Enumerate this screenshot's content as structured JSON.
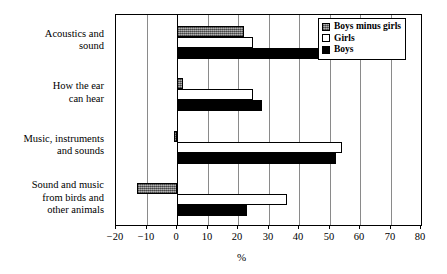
{
  "chart_data": {
    "type": "bar",
    "orientation": "horizontal",
    "title": "",
    "xlabel": "%",
    "ylabel": "",
    "xlim": [
      -20,
      80
    ],
    "xticks": [
      -20,
      -10,
      0,
      10,
      20,
      30,
      40,
      50,
      60,
      70,
      80
    ],
    "xtick_labels": [
      "−20",
      "−10",
      "0",
      "10",
      "20",
      "30",
      "40",
      "50",
      "60",
      "70",
      "80"
    ],
    "grid": true,
    "grid_axis": "x",
    "legend_position": "top-right",
    "categories": [
      "Acoustics and sound",
      "How the ear can hear",
      "Music, instruments and sounds",
      "Sound and music from birds and other animals"
    ],
    "category_label_lines": [
      [
        "Acoustics and",
        "sound"
      ],
      [
        "How the ear",
        "can hear"
      ],
      [
        "Music, instruments",
        "and sounds"
      ],
      [
        "Sound and music",
        "from birds and",
        "other animals"
      ]
    ],
    "series": [
      {
        "name": "Boys minus girls",
        "color": "#808080",
        "fill": "hatched-gray",
        "values": [
          22,
          2,
          -1,
          -13
        ]
      },
      {
        "name": "Girls",
        "color": "#ffffff",
        "fill": "white",
        "values": [
          25,
          25,
          54,
          36
        ]
      },
      {
        "name": "Boys",
        "color": "#000000",
        "fill": "black",
        "values": [
          47,
          28,
          52,
          23
        ]
      }
    ]
  },
  "legend": {
    "items": [
      {
        "label": "Boys minus girls",
        "swatch": "series-diff"
      },
      {
        "label": "Girls",
        "swatch": "series-girls"
      },
      {
        "label": "Boys",
        "swatch": "series-boys"
      }
    ]
  },
  "axis": {
    "x_title": "%"
  }
}
